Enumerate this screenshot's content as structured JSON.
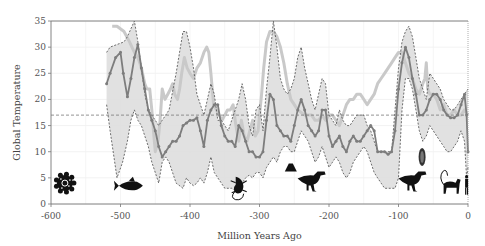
{
  "chart_data": {
    "type": "line",
    "title": "",
    "xlabel": "Million Years Ago",
    "ylabel": "Global Temperature",
    "xlim": [
      -600,
      0
    ],
    "ylim": [
      0,
      35
    ],
    "x_ticks": [
      -600,
      -500,
      -400,
      -300,
      -200,
      -100,
      0
    ],
    "x_tick_labels": [
      "-600",
      "-500",
      "-400",
      "-300",
      "-200",
      "-100",
      "0"
    ],
    "y_ticks": [
      0,
      5,
      10,
      15,
      20,
      25,
      30,
      35
    ],
    "y_tick_labels": [
      "0",
      "5",
      "10",
      "15",
      "20",
      "25",
      "30",
      "35"
    ],
    "grid": true,
    "reference_line": {
      "y": 17,
      "style": "dashed"
    },
    "series": [
      {
        "name": "Mean temperature estimate",
        "style": "dark gray line with markers",
        "color": "#7a7a7a",
        "x": [
          -520,
          -515,
          -507,
          -500,
          -496,
          -490,
          -485,
          -480,
          -475,
          -470,
          -465,
          -460,
          -455,
          -450,
          -445,
          -440,
          -435,
          -430,
          -425,
          -420,
          -415,
          -410,
          -405,
          -400,
          -395,
          -390,
          -385,
          -380,
          -375,
          -370,
          -365,
          -360,
          -355,
          -350,
          -345,
          -340,
          -335,
          -330,
          -325,
          -320,
          -315,
          -310,
          -305,
          -300,
          -295,
          -290,
          -285,
          -280,
          -275,
          -270,
          -265,
          -260,
          -255,
          -250,
          -245,
          -240,
          -235,
          -230,
          -225,
          -220,
          -215,
          -210,
          -205,
          -200,
          -195,
          -190,
          -185,
          -180,
          -175,
          -170,
          -165,
          -160,
          -155,
          -150,
          -145,
          -140,
          -135,
          -130,
          -125,
          -120,
          -115,
          -110,
          -105,
          -100,
          -95,
          -90,
          -85,
          -80,
          -75,
          -70,
          -65,
          -60,
          -55,
          -50,
          -45,
          -40,
          -35,
          -30,
          -25,
          -20,
          -15,
          -10,
          -5,
          -2,
          0
        ],
        "values": [
          23,
          25,
          28,
          29,
          25,
          20.5,
          24,
          28,
          30.5,
          26,
          22,
          18,
          16,
          14,
          11,
          9,
          10,
          11,
          12,
          12,
          13,
          15,
          15.5,
          16,
          16,
          16.5,
          14,
          11,
          16,
          18,
          19,
          19,
          15,
          13,
          12,
          12,
          11,
          15,
          14,
          12,
          10,
          10,
          9,
          9,
          10,
          16,
          21,
          20,
          15,
          14,
          13,
          13,
          12,
          15,
          18,
          20,
          18,
          15,
          14,
          13,
          14,
          18,
          18,
          13,
          11,
          12,
          13,
          11,
          10,
          12,
          13,
          12,
          12,
          13,
          14,
          15,
          14,
          10,
          10,
          10,
          9.5,
          10,
          14,
          22,
          27,
          30,
          28,
          24,
          21,
          17,
          17,
          18,
          20,
          21,
          21,
          20,
          18,
          17,
          16.5,
          16.5,
          17,
          19,
          21,
          17,
          10
        ]
      },
      {
        "name": "Upper bound",
        "style": "dashed line (shaded range)",
        "color": "#555555",
        "x": [
          -520,
          -515,
          -505,
          -495,
          -490,
          -485,
          -480,
          -475,
          -470,
          -465,
          -460,
          -455,
          -450,
          -445,
          -440,
          -430,
          -420,
          -410,
          -405,
          -400,
          -395,
          -390,
          -380,
          -375,
          -370,
          -365,
          -360,
          -355,
          -345,
          -340,
          -335,
          -330,
          -325,
          -320,
          -315,
          -310,
          -305,
          -300,
          -295,
          -290,
          -285,
          -280,
          -275,
          -270,
          -265,
          -260,
          -255,
          -250,
          -245,
          -240,
          -235,
          -230,
          -225,
          -220,
          -215,
          -210,
          -205,
          -200,
          -195,
          -190,
          -185,
          -180,
          -175,
          -170,
          -165,
          -160,
          -150,
          -145,
          -140,
          -135,
          -130,
          -120,
          -115,
          -110,
          -100,
          -95,
          -90,
          -85,
          -80,
          -75,
          -70,
          -65,
          -60,
          -55,
          -50,
          -45,
          -40,
          -35,
          -30,
          -25,
          -20,
          -15,
          -10,
          -5,
          0
        ],
        "values": [
          29,
          30,
          30.5,
          31,
          32,
          33.5,
          35,
          31,
          26,
          21,
          18,
          17,
          16,
          15,
          16,
          18,
          25,
          33,
          33,
          30,
          26,
          21,
          17,
          20,
          23,
          21,
          16,
          16,
          14,
          16,
          18,
          20,
          23,
          20,
          15,
          13,
          18,
          19,
          14,
          22,
          28,
          35,
          30,
          24,
          22,
          21,
          22,
          24,
          28,
          30,
          26,
          23,
          20,
          18,
          21,
          24,
          23,
          17,
          16,
          15,
          18,
          16,
          15,
          15,
          16,
          17,
          17,
          15,
          14,
          12,
          10,
          10,
          10,
          10,
          26,
          31,
          33,
          34,
          32,
          28,
          24,
          22,
          20,
          25,
          24,
          23,
          22,
          20,
          19,
          18,
          18,
          19,
          20,
          21,
          22
        ]
      },
      {
        "name": "Lower bound",
        "style": "dashed line (shaded range)",
        "color": "#555555",
        "x": [
          -520,
          -515,
          -505,
          -497,
          -490,
          -485,
          -480,
          -475,
          -470,
          -465,
          -460,
          -455,
          -450,
          -445,
          -440,
          -435,
          -430,
          -425,
          -420,
          -410,
          -405,
          -400,
          -395,
          -390,
          -385,
          -380,
          -375,
          -370,
          -365,
          -360,
          -355,
          -350,
          -345,
          -340,
          -335,
          -330,
          -325,
          -320,
          -315,
          -310,
          -305,
          -300,
          -295,
          -290,
          -285,
          -280,
          -275,
          -270,
          -265,
          -260,
          -255,
          -250,
          -245,
          -240,
          -235,
          -230,
          -225,
          -220,
          -215,
          -210,
          -205,
          -200,
          -195,
          -190,
          -185,
          -180,
          -175,
          -170,
          -165,
          -160,
          -155,
          -150,
          -145,
          -140,
          -135,
          -130,
          -125,
          -120,
          -115,
          -110,
          -105,
          -100,
          -95,
          -90,
          -85,
          -80,
          -75,
          -70,
          -65,
          -60,
          -55,
          -50,
          -45,
          -40,
          -35,
          -30,
          -25,
          -20,
          -15,
          -10,
          -5,
          -2,
          0
        ],
        "values": [
          19,
          14,
          5,
          8,
          12,
          16,
          18,
          16,
          15,
          13,
          11,
          8,
          6,
          4,
          8,
          9,
          8,
          6,
          4,
          3,
          5,
          4,
          3.5,
          4,
          5,
          4,
          6,
          9,
          6,
          5,
          4,
          3,
          3,
          3,
          2.5,
          3,
          4,
          5,
          5.5,
          5,
          6,
          6,
          5,
          7,
          8,
          9,
          8,
          10,
          11,
          11,
          10,
          10,
          12,
          14,
          13,
          12,
          10,
          8,
          9,
          11,
          9,
          7,
          8,
          9,
          8,
          6,
          5,
          6,
          8,
          9,
          10,
          11,
          10,
          8,
          6,
          5,
          4,
          3,
          3,
          3,
          3,
          5,
          18,
          24,
          24,
          22,
          18,
          14,
          12,
          13,
          15,
          14,
          13,
          12,
          11,
          10,
          10,
          11,
          12,
          14,
          12,
          5,
          7
        ]
      },
      {
        "name": "Alternative temperature curve",
        "style": "light gray thick line",
        "color": "#c8c8c8",
        "x": [
          -512,
          -505,
          -495,
          -487,
          -480,
          -475,
          -470,
          -465,
          -462,
          -458,
          -455,
          -452,
          -450,
          -448,
          -446,
          -443,
          -440,
          -436,
          -432,
          -428,
          -425,
          -422,
          -418,
          -415,
          -412,
          -408,
          -404,
          -400,
          -395,
          -390,
          -385,
          -380,
          -376,
          -373,
          -370,
          -366,
          -362,
          -358,
          -354,
          -350,
          -346,
          -342,
          -338,
          -334,
          -330,
          -326,
          -322,
          -318,
          -314,
          -310,
          -306,
          -302,
          -300,
          -297,
          -294,
          -290,
          -285,
          -280,
          -275,
          -270,
          -265,
          -260,
          -255,
          -250,
          -245,
          -240,
          -235,
          -230,
          -225,
          -220,
          -215,
          -210,
          -205,
          -200,
          -195,
          -190,
          -185,
          -180,
          -175,
          -170,
          -165,
          -160,
          -155,
          -150,
          -145,
          -140,
          -135,
          -130,
          -125,
          -120,
          -115,
          -110,
          -105,
          -100,
          -95,
          -90,
          -85,
          -80,
          -75,
          -70,
          -65,
          -62,
          -60,
          -58,
          -55,
          -50,
          -45,
          -40,
          -35,
          -30,
          -25,
          -20,
          -15,
          -10,
          -5,
          0
        ],
        "values": [
          34,
          34,
          33,
          31,
          29,
          28,
          26,
          23,
          22,
          22,
          18,
          13,
          10,
          11,
          12,
          16,
          22,
          20,
          21,
          22,
          23,
          21,
          20,
          22,
          25,
          28,
          26,
          25,
          24,
          26,
          27,
          29,
          30,
          29,
          25,
          19,
          18,
          17,
          16,
          17,
          18,
          18,
          19,
          15,
          12,
          16,
          13,
          12,
          14,
          16,
          13,
          14,
          17,
          21,
          26,
          31,
          33,
          33,
          32,
          30,
          27,
          23,
          20,
          19,
          18,
          17.5,
          17,
          17,
          17,
          16,
          16,
          17,
          16,
          17,
          17,
          16,
          15,
          17,
          19,
          20,
          20,
          21,
          21,
          20,
          19,
          20,
          21,
          23,
          24,
          25,
          26,
          27,
          28,
          29,
          29,
          27,
          25,
          24,
          22,
          21,
          23,
          24,
          27,
          22,
          21,
          21,
          20,
          18,
          19,
          17,
          17,
          18,
          17,
          17,
          18,
          17
        ]
      }
    ],
    "annotations": [
      {
        "type": "icon",
        "name": "microorganism-icon",
        "x": -580,
        "y": 4
      },
      {
        "type": "icon",
        "name": "fish-icon",
        "x": -485,
        "y": 3.5
      },
      {
        "type": "icon",
        "name": "lizard-icon",
        "x": -330,
        "y": 3.5
      },
      {
        "type": "icon",
        "name": "volcano-icon",
        "x": -255,
        "y": 7
      },
      {
        "type": "icon",
        "name": "dinosaur-icon",
        "x": -225,
        "y": 4.5
      },
      {
        "type": "icon",
        "name": "dinosaur-icon",
        "x": -80,
        "y": 4.5
      },
      {
        "type": "icon",
        "name": "asteroid-icon",
        "x": -66,
        "y": 9
      },
      {
        "type": "icon",
        "name": "monkey-icon",
        "x": -25,
        "y": 3.5
      },
      {
        "type": "icon",
        "name": "human-icon",
        "x": -2,
        "y": 3.5
      }
    ]
  }
}
